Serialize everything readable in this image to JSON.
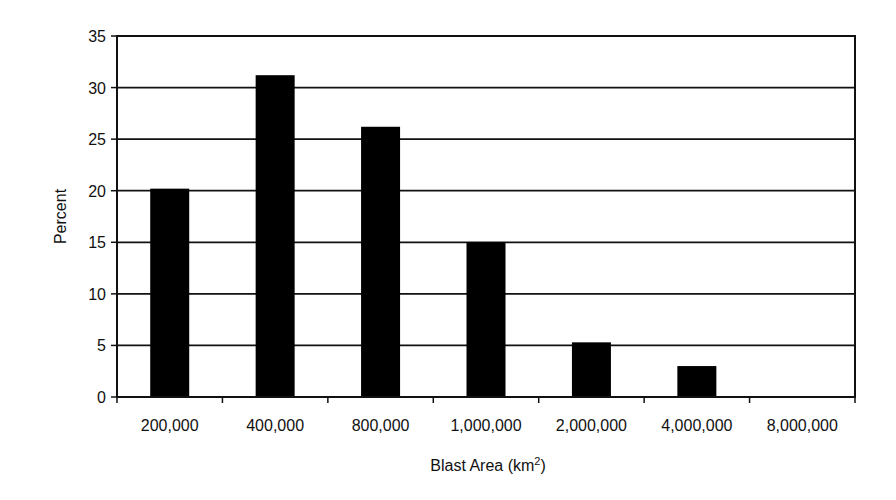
{
  "chart_data": {
    "type": "bar",
    "title": "",
    "xlabel": "Blast Area (km2)",
    "xlabel_base": "Blast Area (km",
    "xlabel_sup": "2",
    "xlabel_close": ")",
    "ylabel": "Percent",
    "categories": [
      "200,000",
      "400,000",
      "800,000",
      "1,000,000",
      "2,000,000",
      "4,000,000",
      "8,000,000"
    ],
    "values": [
      20.2,
      31.2,
      26.2,
      15.0,
      5.3,
      3.0,
      0
    ],
    "ylim": [
      0,
      35
    ],
    "yticks": [
      0,
      5,
      10,
      15,
      20,
      25,
      30,
      35
    ],
    "grid": true,
    "legend": null,
    "bar_color": "#000000"
  }
}
